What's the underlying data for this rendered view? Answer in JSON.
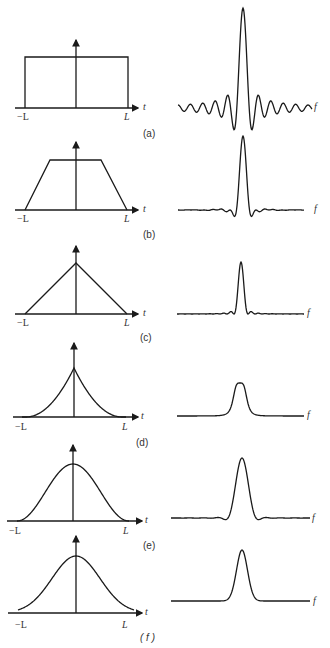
{
  "figure": {
    "axis_labels": {
      "time": "t",
      "freq": "f",
      "neg_L": "−L",
      "pos_L": "L"
    },
    "panels": [
      {
        "id": "a",
        "label": "(a)",
        "shape": "rectangle",
        "transform": "sinc with strong sidelobes"
      },
      {
        "id": "b",
        "label": "(b)",
        "shape": "trapezoid",
        "transform": "main lobe with small sidelobes"
      },
      {
        "id": "c",
        "label": "(c)",
        "shape": "triangle",
        "transform": "narrow peak with tiny sidelobes"
      },
      {
        "id": "d",
        "label": "(d)",
        "shape": "cusp (concave sides)",
        "transform": "smooth peak, no sidelobes"
      },
      {
        "id": "e",
        "label": "(e)",
        "shape": "raised cosine",
        "transform": "peak with small negative dips"
      },
      {
        "id": "f",
        "label": "( f )",
        "shape": "gaussian-like",
        "transform": "smooth gaussian peak"
      }
    ]
  },
  "style": {
    "stroke": "#1a1a1a",
    "background": "#ffffff"
  }
}
